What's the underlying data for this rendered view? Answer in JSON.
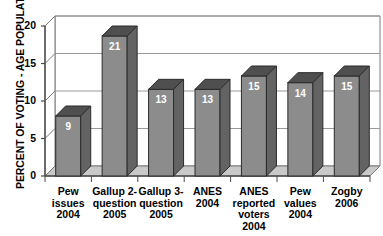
{
  "chart_data": {
    "type": "bar",
    "title": "",
    "subtitle": "",
    "xlabel": "",
    "ylabel": "PERCENT OF VOTING - AGE POPULATION",
    "ylim": [
      0,
      22.5
    ],
    "yticks": [
      0,
      5,
      10,
      15,
      20
    ],
    "ytick_labels": [
      "0",
      "5",
      "10",
      "15",
      "20"
    ],
    "grid": true,
    "grid_axis": "y",
    "legend": false,
    "legend_position": "none",
    "style": "3d-column",
    "bar_face_color": "#8c8c8c",
    "bar_top_color": "#4f4f4f",
    "bar_side_color": "#636363",
    "bar_edge_color": "#2b2b2b",
    "floor_color": "#c9c9c9",
    "gridline_color": "#9a9a9a",
    "value_label_color": "#ffffff",
    "categories": [
      "Pew\nissues\n2004",
      "Gallup 2-\nquestion\n2005",
      "Gallup 3-\nquestion\n2005",
      "ANES\n2004",
      "ANES\nreported\nvoters\n2004",
      "Pew\nvalues\n2004",
      "Zogby\n2006"
    ],
    "values": [
      9,
      21,
      13,
      13,
      15,
      14,
      15
    ],
    "value_labels": [
      "9",
      "21",
      "13",
      "13",
      "15",
      "14",
      "15"
    ]
  }
}
